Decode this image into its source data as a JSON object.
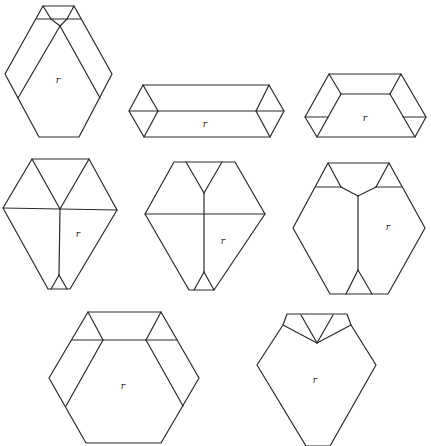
{
  "figure": {
    "stroke_color": "#2a2a2a",
    "background": "#ffffff",
    "shapes": [
      {
        "id": 1,
        "label": "r",
        "label_pos": [
          58,
          83
        ],
        "outline": [
          [
            43,
            6
          ],
          [
            74,
            6
          ],
          [
            112,
            74
          ],
          [
            79,
            137
          ],
          [
            39,
            137
          ],
          [
            5,
            74
          ]
        ],
        "segments": [
          [
            [
              36,
              19
            ],
            [
              81,
              19
            ]
          ],
          [
            [
              43,
              6
            ],
            [
              51,
              19
            ]
          ],
          [
            [
              74,
              6
            ],
            [
              67,
              19
            ]
          ],
          [
            [
              51,
              19
            ],
            [
              60,
              26
            ]
          ],
          [
            [
              67,
              19
            ],
            [
              60,
              26
            ]
          ],
          [
            [
              60,
              26
            ],
            [
              18,
              98
            ]
          ],
          [
            [
              60,
              26
            ],
            [
              100,
              98
            ]
          ]
        ]
      },
      {
        "id": 2,
        "label": "r",
        "label_pos": [
          205,
          127
        ],
        "outline": [
          [
            143,
            85
          ],
          [
            269,
            85
          ],
          [
            284,
            111
          ],
          [
            270,
            137
          ],
          [
            144,
            137
          ],
          [
            129,
            111
          ]
        ],
        "segments": [
          [
            [
              129,
              111
            ],
            [
              284,
              111
            ]
          ],
          [
            [
              143,
              85
            ],
            [
              158,
              111
            ]
          ],
          [
            [
              158,
              111
            ],
            [
              144,
              137
            ]
          ],
          [
            [
              269,
              85
            ],
            [
              256,
              111
            ]
          ],
          [
            [
              256,
              111
            ],
            [
              270,
              137
            ]
          ]
        ]
      },
      {
        "id": 3,
        "label": "r",
        "label_pos": [
          365,
          121
        ],
        "outline": [
          [
            329,
            74
          ],
          [
            401,
            74
          ],
          [
            426,
            117
          ],
          [
            415,
            137
          ],
          [
            317,
            137
          ],
          [
            305,
            117
          ]
        ],
        "segments": [
          [
            [
              329,
              74
            ],
            [
              341,
              94
            ]
          ],
          [
            [
              401,
              74
            ],
            [
              390,
              94
            ]
          ],
          [
            [
              341,
              94
            ],
            [
              390,
              94
            ]
          ],
          [
            [
              341,
              94
            ],
            [
              317,
              137
            ]
          ],
          [
            [
              390,
              94
            ],
            [
              415,
              137
            ]
          ],
          [
            [
              305,
              117
            ],
            [
              328,
              117
            ]
          ],
          [
            [
              403,
              117
            ],
            [
              426,
              117
            ]
          ]
        ]
      },
      {
        "id": 4,
        "label": "r",
        "label_pos": [
          78,
          237
        ],
        "outline": [
          [
            32,
            159
          ],
          [
            89,
            159
          ],
          [
            117,
            210
          ],
          [
            70,
            289
          ],
          [
            48,
            289
          ],
          [
            3,
            208
          ]
        ],
        "segments": [
          [
            [
              3,
              208
            ],
            [
              117,
              210
            ]
          ],
          [
            [
              32,
              159
            ],
            [
              60,
              209
            ]
          ],
          [
            [
              89,
              159
            ],
            [
              60,
              209
            ]
          ],
          [
            [
              60,
              209
            ],
            [
              59,
              275
            ]
          ],
          [
            [
              59,
              275
            ],
            [
              51,
              289
            ]
          ],
          [
            [
              59,
              275
            ],
            [
              67,
              289
            ]
          ]
        ]
      },
      {
        "id": 5,
        "label": "r",
        "label_pos": [
          223,
          244
        ],
        "outline": [
          [
            174,
            162
          ],
          [
            235,
            162
          ],
          [
            265,
            214
          ],
          [
            214,
            290
          ],
          [
            189,
            290
          ],
          [
            145,
            214
          ]
        ],
        "segments": [
          [
            [
              145,
              214
            ],
            [
              265,
              214
            ]
          ],
          [
            [
              186,
              162
            ],
            [
              204,
              193
            ]
          ],
          [
            [
              222,
              162
            ],
            [
              204,
              193
            ]
          ],
          [
            [
              204,
              193
            ],
            [
              204,
              272
            ]
          ],
          [
            [
              204,
              272
            ],
            [
              194,
              290
            ]
          ],
          [
            [
              204,
              272
            ],
            [
              214,
              290
            ]
          ]
        ]
      },
      {
        "id": 6,
        "label": "r",
        "label_pos": [
          388,
          230
        ],
        "outline": [
          [
            328,
            163
          ],
          [
            389,
            163
          ],
          [
            425,
            228
          ],
          [
            388,
            294
          ],
          [
            330,
            294
          ],
          [
            293,
            228
          ]
        ],
        "segments": [
          [
            [
              316,
              187
            ],
            [
              341,
              187
            ]
          ],
          [
            [
              376,
              187
            ],
            [
              402,
              187
            ]
          ],
          [
            [
              328,
              163
            ],
            [
              341,
              187
            ]
          ],
          [
            [
              389,
              163
            ],
            [
              376,
              187
            ]
          ],
          [
            [
              341,
              187
            ],
            [
              358,
              196
            ]
          ],
          [
            [
              376,
              187
            ],
            [
              358,
              196
            ]
          ],
          [
            [
              358,
              196
            ],
            [
              358,
              270
            ]
          ],
          [
            [
              358,
              270
            ],
            [
              346,
              294
            ]
          ],
          [
            [
              358,
              270
            ],
            [
              372,
              294
            ]
          ]
        ]
      },
      {
        "id": 7,
        "label": "r",
        "label_pos": [
          123,
          389
        ],
        "outline": [
          [
            88,
            312
          ],
          [
            161,
            312
          ],
          [
            199,
            378
          ],
          [
            161,
            443
          ],
          [
            86,
            443
          ],
          [
            49,
            378
          ]
        ],
        "segments": [
          [
            [
              72,
              340
            ],
            [
              177,
              340
            ]
          ],
          [
            [
              88,
              312
            ],
            [
              103,
              340
            ]
          ],
          [
            [
              161,
              312
            ],
            [
              146,
              340
            ]
          ],
          [
            [
              103,
              340
            ],
            [
              66,
              406
            ]
          ],
          [
            [
              146,
              340
            ],
            [
              183,
              406
            ]
          ]
        ]
      },
      {
        "id": 8,
        "label": "r",
        "label_pos": [
          315,
          383
        ],
        "outline": [
          [
            287,
            314
          ],
          [
            347,
            314
          ],
          [
            351,
            325
          ],
          [
            376,
            365
          ],
          [
            330,
            446
          ],
          [
            306,
            446
          ],
          [
            257,
            365
          ],
          [
            283,
            325
          ]
        ],
        "segments": [
          [
            [
              283,
              325
            ],
            [
              317,
              343
            ]
          ],
          [
            [
              301,
              315
            ],
            [
              317,
              343
            ]
          ],
          [
            [
              333,
              315
            ],
            [
              317,
              343
            ]
          ],
          [
            [
              351,
              325
            ],
            [
              317,
              343
            ]
          ]
        ]
      }
    ]
  }
}
